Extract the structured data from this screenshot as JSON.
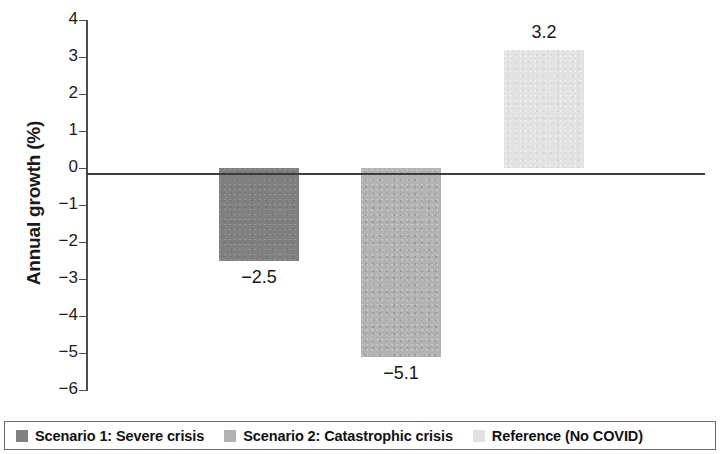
{
  "chart_data": {
    "type": "bar",
    "title": "",
    "subtitle": "",
    "xlabel": "",
    "ylabel": "Annual growth (%)",
    "ylim": [
      -6,
      4
    ],
    "ytick_step": 1,
    "grid": false,
    "legend_position": "bottom",
    "categories": [
      "Scenario 1: Severe crisis",
      "Scenario 2: Catastrophic crisis",
      "Reference (No COVID)"
    ],
    "values": [
      -2.5,
      -5.1,
      3.2
    ],
    "value_labels": [
      "−2.5",
      "−5.1",
      "3.2"
    ],
    "bar_colors": [
      "#808080",
      "#b2b2b2",
      "#e2e2e2"
    ],
    "ytick_labels": [
      "4",
      "3",
      "2",
      "1",
      "0",
      "−1",
      "−2",
      "−3",
      "−4",
      "−5",
      "−6"
    ],
    "ytick_values": [
      4,
      3,
      2,
      1,
      0,
      -1,
      -2,
      -3,
      -4,
      -5,
      -6
    ]
  },
  "axis": {
    "y_title": "Annual growth (%)"
  },
  "legend": {
    "items": [
      {
        "label": "Scenario 1: Severe crisis",
        "color": "#808080"
      },
      {
        "label": "Scenario 2: Catastrophic crisis",
        "color": "#b2b2b2"
      },
      {
        "label": "Reference (No COVID)",
        "color": "#e2e2e2"
      }
    ]
  }
}
